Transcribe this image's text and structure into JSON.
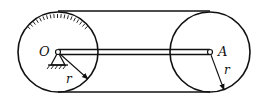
{
  "diagram": {
    "labels": {
      "left_center": "O",
      "right_center": "A",
      "left_radius": "r",
      "right_radius": "r"
    },
    "colors": {
      "stroke": "#111111",
      "background": "#ffffff"
    }
  }
}
